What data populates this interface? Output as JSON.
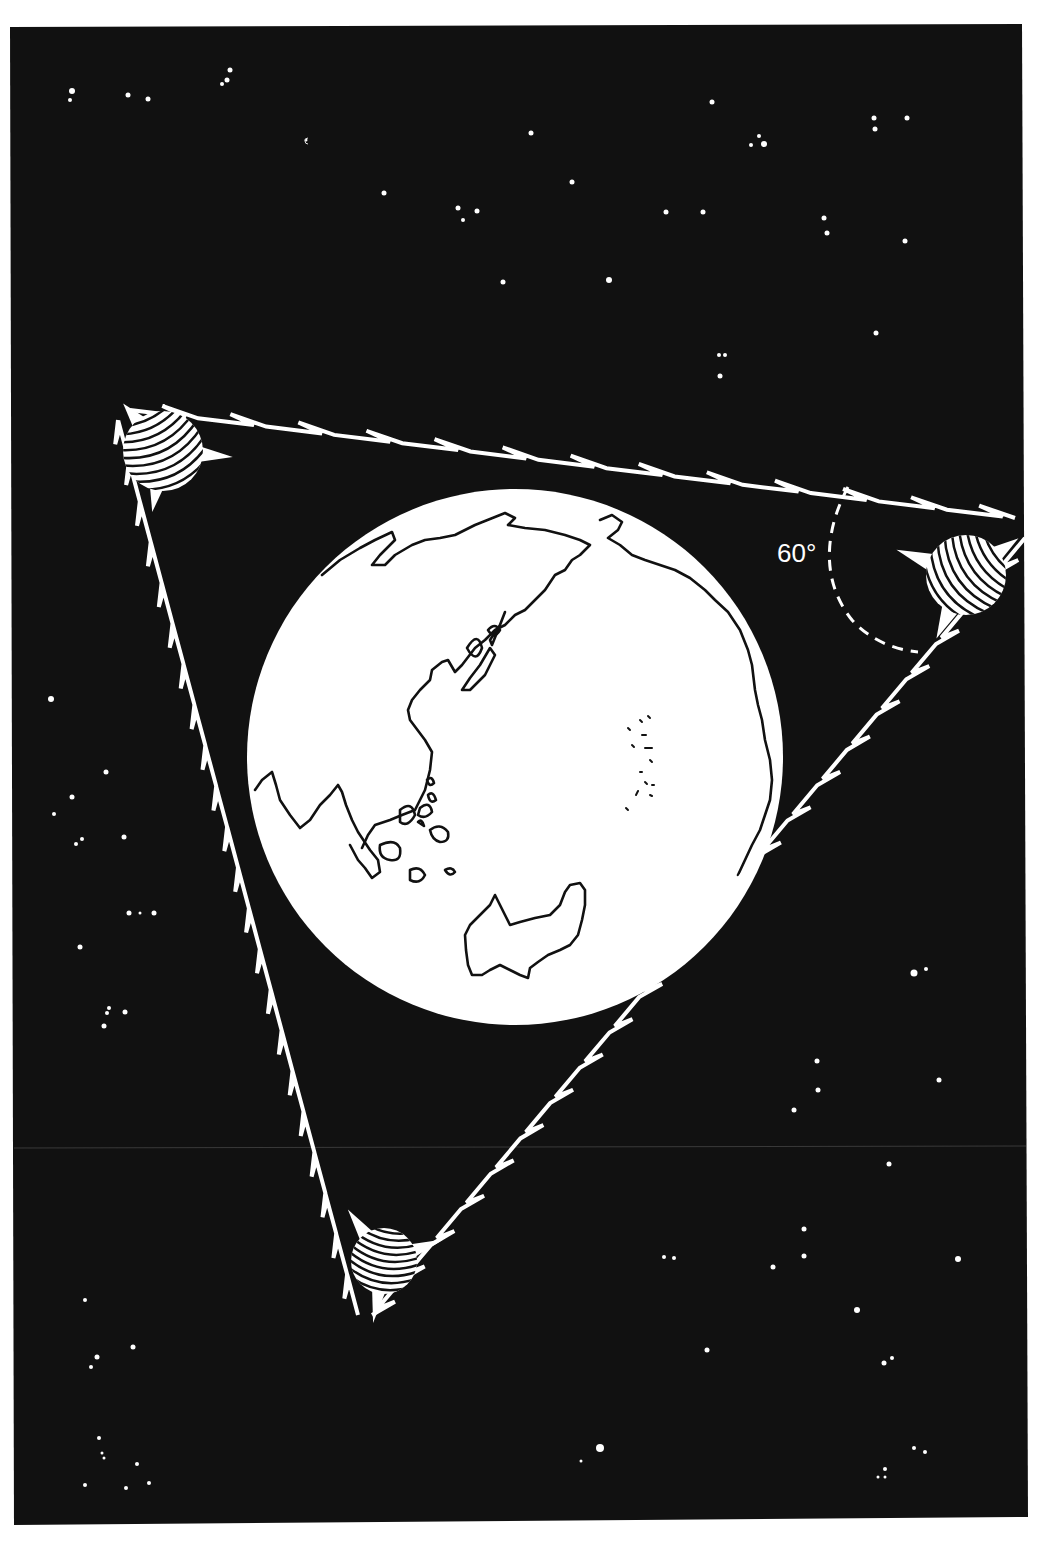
{
  "illustration": {
    "subject": "Three geostationary satellites spaced around the Earth forming a triangular relay network",
    "colors": {
      "page_background": "#ffffff",
      "space": "#111111",
      "foreground": "#ffffff",
      "outline": "#111111"
    },
    "angle_annotation": {
      "label": "60°",
      "degrees": 60
    },
    "satellites": [
      {
        "id": "satellite-top-left",
        "position": "top-left vertex"
      },
      {
        "id": "satellite-right",
        "position": "right vertex"
      },
      {
        "id": "satellite-bottom",
        "position": "bottom vertex"
      }
    ],
    "links": [
      {
        "id": "link-top",
        "from": "satellite-top-left",
        "to": "satellite-right",
        "style": "zigzag"
      },
      {
        "id": "link-right",
        "from": "satellite-right",
        "to": "satellite-bottom",
        "style": "zigzag"
      },
      {
        "id": "link-left",
        "from": "satellite-bottom",
        "to": "satellite-top-left",
        "style": "zigzag"
      }
    ],
    "earth": {
      "view": "Pacific / Asia-Australia hemisphere",
      "features": [
        "Asia",
        "Japan",
        "Indonesia",
        "Australia",
        "North America edge",
        "Pacific islands"
      ]
    }
  }
}
